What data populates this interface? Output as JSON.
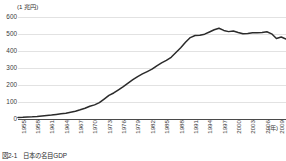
{
  "figure": {
    "unit_label": "(1 兆円)",
    "xaxis_unit": "(年)",
    "caption": "図2-1　日本の名目GDP"
  },
  "chart_data": {
    "type": "line",
    "title": "",
    "xlabel": "(年)",
    "ylabel": "(1 兆円)",
    "ylim": [
      0,
      600
    ],
    "yticks": [
      0,
      100,
      200,
      300,
      400,
      500,
      600
    ],
    "ytick_labels": [
      "0",
      "100",
      "200",
      "300",
      "400",
      "500",
      "600"
    ],
    "grid": true,
    "legend": "none",
    "xtick_labels": [
      "1955",
      "1958",
      "1961",
      "1964",
      "1967",
      "1970",
      "1973",
      "1976",
      "1979",
      "1982",
      "1985",
      "1988",
      "1991",
      "1994",
      "1997",
      "2000",
      "2003",
      "2006",
      "2009",
      "2011"
    ],
    "xlim": [
      1955,
      2011
    ],
    "line_color": "#2b2b2b",
    "x": [
      1955,
      1956,
      1957,
      1958,
      1959,
      1960,
      1961,
      1962,
      1963,
      1964,
      1965,
      1966,
      1967,
      1968,
      1969,
      1970,
      1971,
      1972,
      1973,
      1974,
      1975,
      1976,
      1977,
      1978,
      1979,
      1980,
      1981,
      1982,
      1983,
      1984,
      1985,
      1986,
      1987,
      1988,
      1989,
      1990,
      1991,
      1992,
      1993,
      1994,
      1995,
      1996,
      1997,
      1998,
      1999,
      2000,
      2001,
      2002,
      2003,
      2004,
      2005,
      2006,
      2007,
      2008,
      2009,
      2010,
      2011
    ],
    "values": [
      9,
      10,
      12,
      13,
      15,
      18,
      21,
      23,
      27,
      31,
      34,
      40,
      46,
      54,
      63,
      75,
      83,
      96,
      117,
      139,
      153,
      172,
      191,
      211,
      231,
      249,
      265,
      279,
      293,
      313,
      330,
      345,
      363,
      391,
      419,
      451,
      479,
      491,
      493,
      499,
      512,
      525,
      534,
      521,
      514,
      518,
      509,
      501,
      503,
      507,
      508,
      509,
      513,
      501,
      474,
      482,
      470
    ]
  }
}
